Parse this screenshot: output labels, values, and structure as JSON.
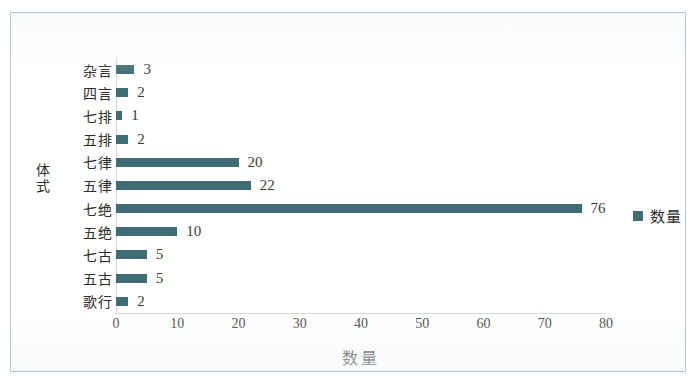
{
  "chart_data": {
    "type": "bar",
    "orientation": "horizontal",
    "title": "",
    "xlabel": "数量",
    "ylabel": "体式",
    "categories": [
      "杂言",
      "四言",
      "七排",
      "五排",
      "七律",
      "五律",
      "七绝",
      "五绝",
      "七古",
      "五古",
      "歌行"
    ],
    "values": [
      3,
      2,
      1,
      2,
      20,
      22,
      76,
      10,
      5,
      5,
      2
    ],
    "data_labels": [
      "3",
      "2",
      "1",
      "2",
      "20",
      "22",
      "76",
      "10",
      "5",
      "5",
      "2"
    ],
    "xlim": [
      0,
      80
    ],
    "xticks": [
      0,
      10,
      20,
      30,
      40,
      50,
      60,
      70,
      80
    ],
    "xtick_labels": [
      "0",
      "10",
      "20",
      "30",
      "40",
      "50",
      "60",
      "70",
      "80"
    ],
    "grid": false,
    "legend_position": "right",
    "series": [
      {
        "name": "数量",
        "color": "#3f6b72",
        "values": [
          3,
          2,
          1,
          2,
          20,
          22,
          76,
          10,
          5,
          5,
          2
        ]
      }
    ]
  },
  "legend": {
    "entries": [
      {
        "label": "数量",
        "color": "#3f6b72"
      }
    ]
  },
  "colors": {
    "bar": "#3f6b72",
    "frame": "#b9c6d6",
    "axis": "#cfd8e4",
    "text": "#2d2d2d",
    "background": "#ffffff"
  }
}
